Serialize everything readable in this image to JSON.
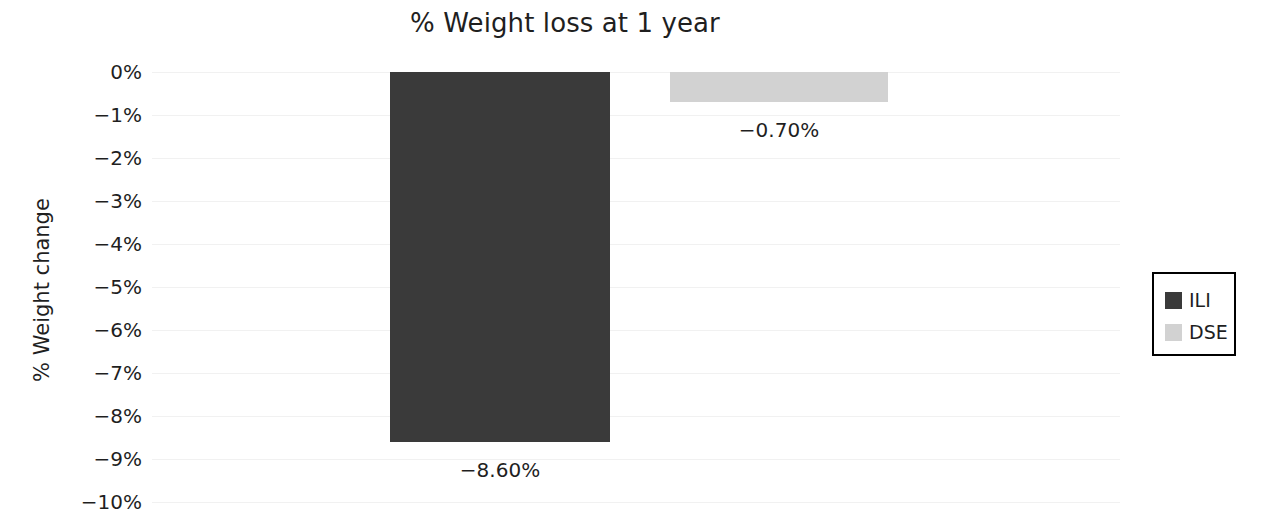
{
  "chart_data": {
    "type": "bar",
    "title": "% Weight loss at 1 year",
    "xlabel": "",
    "ylabel": "% Weight change",
    "categories": [
      "ILI",
      "DSE"
    ],
    "values": [
      -8.6,
      -0.7
    ],
    "value_labels": [
      "−8.60%",
      "−0.70%"
    ],
    "ylim": [
      -10,
      0
    ],
    "ytick_values": [
      0,
      -1,
      -2,
      -3,
      -4,
      -5,
      -6,
      -7,
      -8,
      -9,
      -10
    ],
    "ytick_labels": [
      "0%",
      "−1%",
      "−2%",
      "−3%",
      "−4%",
      "−5%",
      "−6%",
      "−7%",
      "−8%",
      "−9%",
      "−10%"
    ],
    "grid": true,
    "grid_axis": "y",
    "legend_position": "right",
    "series": [
      {
        "name": "ILI",
        "value": -8.6,
        "color": "#3a3a3a"
      },
      {
        "name": "DSE",
        "value": -0.7,
        "color": "#d2d2d2"
      }
    ]
  },
  "legend": {
    "entries": [
      {
        "label": "ILI",
        "color": "#3a3a3a"
      },
      {
        "label": "DSE",
        "color": "#d2d2d2"
      }
    ]
  },
  "colors": {
    "ili_bar": "#3a3a3a",
    "dse_bar": "#d2d2d2",
    "gridline": "#f1f1f1",
    "text": "#1f1f1f",
    "legend_border": "#000000",
    "background": "#ffffff"
  }
}
